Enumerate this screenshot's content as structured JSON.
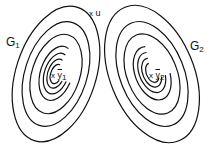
{
  "diagram": {
    "groups": [
      {
        "name": "G",
        "sub": "1",
        "center_name": "y",
        "center_sub": "1",
        "center_marker": "x"
      },
      {
        "name": "G",
        "sub": "2",
        "center_name": "y",
        "center_sub": "2",
        "center_marker": "x"
      }
    ],
    "point": {
      "marker": "x",
      "name": "u"
    },
    "stroke_color": "#111111"
  }
}
